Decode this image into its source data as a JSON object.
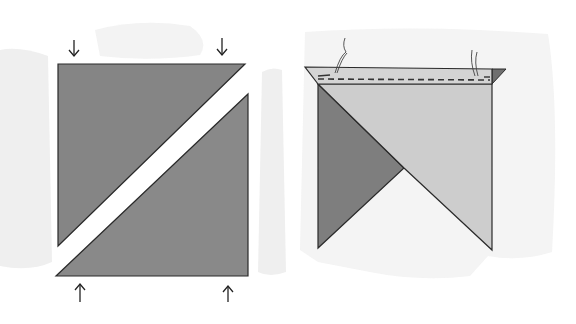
{
  "figure": {
    "colors": {
      "background": "#ffffff",
      "wash": "#ececec",
      "dark_fabric": "#8a8a8a",
      "light_fabric": "#cfcfcf",
      "outline": "#2a2a2a",
      "stitch": "#3a3a3a"
    },
    "left_panel": {
      "label": "Two triangles cut from a square",
      "arrows_top": [
        "down-arrow",
        "down-arrow"
      ],
      "arrows_bottom": [
        "up-arrow",
        "up-arrow"
      ]
    },
    "right_panel": {
      "label": "Triangles stitched along top edge with thread tails"
    }
  }
}
